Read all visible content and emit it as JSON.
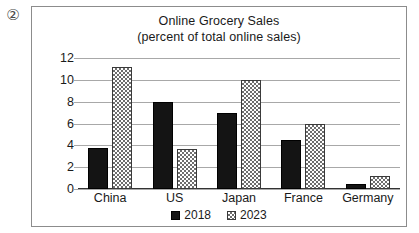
{
  "margin_mark": "②",
  "chart_data": {
    "type": "bar",
    "title": "Online Grocery Sales",
    "subtitle": "(percent of total online sales)",
    "xlabel": "",
    "ylabel": "",
    "ylim": [
      0,
      12
    ],
    "ytick_step": 2,
    "yticks": [
      "12",
      "10",
      "8",
      "6",
      "4",
      "2",
      "0"
    ],
    "ytick_values": [
      12,
      10,
      8,
      6,
      4,
      2,
      0
    ],
    "grid": true,
    "legend_position": "bottom",
    "categories": [
      "China",
      "US",
      "Japan",
      "France",
      "Germany"
    ],
    "series": [
      {
        "name": "2018",
        "values": [
          3.8,
          8.0,
          7.0,
          4.5,
          0.5
        ],
        "fill": "solid-black",
        "color": "#141414"
      },
      {
        "name": "2023",
        "values": [
          11.2,
          3.7,
          10.0,
          6.0,
          1.2
        ],
        "fill": "checkerboard",
        "color": "#6e6e6e"
      }
    ]
  }
}
